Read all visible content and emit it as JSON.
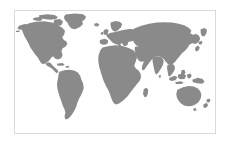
{
  "widget": {
    "name": "world-map",
    "title": "World Map",
    "projection": "equirectangular",
    "width": 229,
    "height": 144
  },
  "frame": {
    "border_color": "#dadada",
    "border_width": 1,
    "left": 14,
    "top": 10,
    "width": 202,
    "height": 124
  },
  "colors": {
    "land": "#8a8a8a",
    "ocean": "#ffffff",
    "page_background": "#ffffff",
    "frame_border": "#dadada"
  },
  "legend": {
    "visible": false,
    "entries": []
  },
  "labels": {
    "visible": false,
    "entries": []
  },
  "regions": [
    {
      "id": "north-america",
      "name": "North America"
    },
    {
      "id": "greenland",
      "name": "Greenland"
    },
    {
      "id": "south-america",
      "name": "South America"
    },
    {
      "id": "europe",
      "name": "Europe"
    },
    {
      "id": "africa",
      "name": "Africa"
    },
    {
      "id": "asia",
      "name": "Asia"
    },
    {
      "id": "australia",
      "name": "Australia"
    },
    {
      "id": "new-zealand",
      "name": "New Zealand"
    },
    {
      "id": "indonesia",
      "name": "Indonesia"
    },
    {
      "id": "japan",
      "name": "Japan"
    },
    {
      "id": "british-isles",
      "name": "British Isles"
    },
    {
      "id": "madagascar",
      "name": "Madagascar"
    },
    {
      "id": "iceland",
      "name": "Iceland"
    },
    {
      "id": "caribbean",
      "name": "Caribbean"
    },
    {
      "id": "philippines",
      "name": "Philippines"
    },
    {
      "id": "sri-lanka",
      "name": "Sri Lanka"
    }
  ]
}
